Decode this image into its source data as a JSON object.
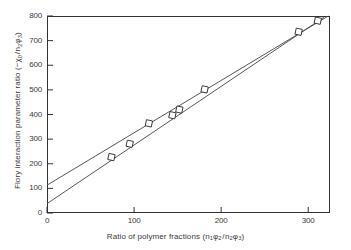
{
  "chart_data": {
    "type": "scatter",
    "title": "",
    "xlabel": "Ratio of polymer fractions (n1φ2/n2φ3)",
    "ylabel": "Flory interaction parameter ratio (−χ0/n2φ3)",
    "xlim": [
      0,
      325
    ],
    "ylim": [
      0,
      800
    ],
    "xticks": [
      0,
      100,
      200,
      300
    ],
    "yticks": [
      0,
      100,
      200,
      300,
      400,
      500,
      600,
      700,
      800
    ],
    "grid": false,
    "legend": "none",
    "marker": "open-square",
    "points": [
      {
        "x": 74,
        "y": 227
      },
      {
        "x": 95,
        "y": 281
      },
      {
        "x": 117,
        "y": 364
      },
      {
        "x": 144,
        "y": 397
      },
      {
        "x": 152,
        "y": 420
      },
      {
        "x": 181,
        "y": 502
      },
      {
        "x": 289,
        "y": 736
      },
      {
        "x": 311,
        "y": 781
      }
    ],
    "series": [
      {
        "name": "upper-fit-line",
        "type": "line",
        "intercept": 113,
        "x_endpoints": [
          0,
          323
        ],
        "y_endpoints": [
          113,
          800
        ]
      },
      {
        "name": "lower-fit-line",
        "type": "line",
        "intercept": 38,
        "x_endpoints": [
          0,
          318
        ],
        "y_endpoints": [
          38,
          795
        ]
      }
    ],
    "annotations": []
  },
  "axis": {
    "x_tick_labels": [
      "0",
      "100",
      "200",
      "300"
    ],
    "y_tick_labels": [
      "0",
      "100",
      "200",
      "300",
      "400",
      "500",
      "600",
      "700",
      "800"
    ],
    "xlabel_parts": {
      "lead": "Ratio of polymer fractions  (n",
      "sub1": "1",
      "phi1": "φ",
      "sub2": "2",
      "slash": "/",
      "n2": "n",
      "sub3": "2",
      "phi2": "φ",
      "sub4": "3",
      "close": ")"
    },
    "ylabel_parts": {
      "lead": "Flory interaction parameter ratio  (−χ",
      "sub0": "0",
      "slash": "/",
      "n2": "n",
      "sub2": "2",
      "phi": "φ",
      "sub3": "3",
      "close": ")"
    }
  },
  "colors": {
    "axis": "#333333",
    "line": "#444444",
    "marker_stroke": "#333333",
    "background": "#ffffff",
    "text": "#3a3a3a"
  }
}
